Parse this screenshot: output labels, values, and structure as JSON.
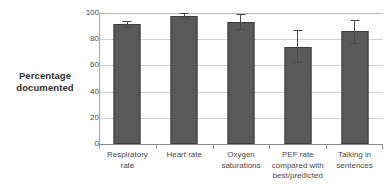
{
  "chart_data": {
    "type": "bar",
    "title": "",
    "title_note": "title cropped off at top edge of screenshot",
    "xlabel": "",
    "ylabel": "Percentage documented",
    "ylim": [
      0,
      100
    ],
    "yticks": [
      0,
      20,
      40,
      60,
      80,
      100
    ],
    "grid": true,
    "legend": "none",
    "categories": [
      "Respiratory rate",
      "Heart rate",
      "Oxygen saturations",
      "PEF rate compared with best/predicted",
      "Talking in sentences"
    ],
    "category_lines": [
      [
        "Respiratory",
        "rate"
      ],
      [
        "Heart rate"
      ],
      [
        "Oxygen",
        "saturations"
      ],
      [
        "PEF rate",
        "compared with",
        "best/predicted"
      ],
      [
        "Talking in",
        "sentences"
      ]
    ],
    "values": [
      91.5,
      98,
      93,
      74,
      86
    ],
    "error_low": [
      88.5,
      96,
      87,
      62,
      76
    ],
    "error_high": [
      94,
      100,
      99,
      87,
      95
    ],
    "bar_color": "#595959",
    "bar_border_color": "#3d3d3d",
    "grid_color": "#d2d2d2",
    "axis_color": "#8c8c8c"
  },
  "axis": {
    "y_title_lines": [
      "Percentage",
      "documented"
    ],
    "y_tick_labels": [
      "100",
      "80",
      "60",
      "40",
      "20",
      "0"
    ]
  }
}
